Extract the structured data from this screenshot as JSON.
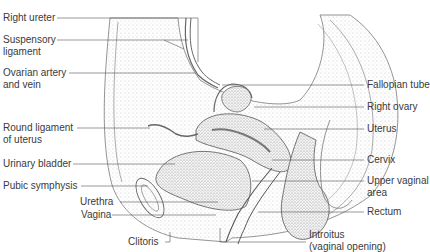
{
  "figure": {
    "labels_left": [
      {
        "id": "right-ureter",
        "lines": [
          "Right ureter"
        ]
      },
      {
        "id": "suspensory-ligament",
        "lines": [
          "Suspensory",
          "ligament"
        ]
      },
      {
        "id": "ovarian-artery-vein",
        "lines": [
          "Ovarian artery",
          "and vein"
        ]
      },
      {
        "id": "round-ligament",
        "lines": [
          "Round ligament",
          "of uterus"
        ]
      },
      {
        "id": "urinary-bladder",
        "lines": [
          "Urinary bladder"
        ]
      },
      {
        "id": "pubic-symphysis",
        "lines": [
          "Pubic symphysis"
        ]
      },
      {
        "id": "urethra",
        "lines": [
          "Urethra"
        ]
      },
      {
        "id": "vagina",
        "lines": [
          "Vagina"
        ]
      },
      {
        "id": "clitoris",
        "lines": [
          "Clitoris"
        ]
      }
    ],
    "labels_right": [
      {
        "id": "fallopian-tube",
        "lines": [
          "Fallopian tube"
        ]
      },
      {
        "id": "right-ovary",
        "lines": [
          "Right ovary"
        ]
      },
      {
        "id": "uterus",
        "lines": [
          "Uterus"
        ]
      },
      {
        "id": "cervix",
        "lines": [
          "Cervix"
        ]
      },
      {
        "id": "upper-vaginal-area",
        "lines": [
          "Upper vaginal",
          "area"
        ]
      },
      {
        "id": "rectum",
        "lines": [
          "Rectum"
        ]
      },
      {
        "id": "introitus",
        "lines": [
          "Introitus",
          "(vaginal opening)"
        ]
      }
    ]
  },
  "colors": {
    "ink": "#3a3a3a",
    "line": "#555555",
    "tissue": "#c8c8c8",
    "background": "#ffffff"
  }
}
